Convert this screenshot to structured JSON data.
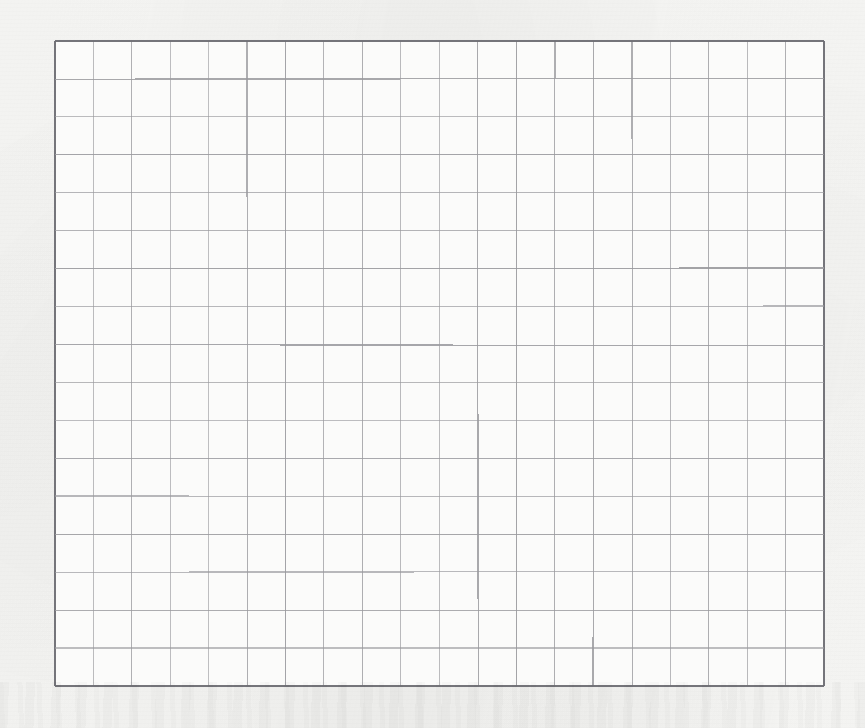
{
  "page": {
    "width": 865,
    "height": 728,
    "background_color": "#f7f7f5",
    "paper_tint": "#f4f4f2",
    "document_type": "scanned graph paper sheet",
    "visible_text": "",
    "annotations": []
  },
  "grid": {
    "label": "graph-paper-grid",
    "x": 55,
    "y": 41,
    "width": 769,
    "height": 645,
    "columns": 20,
    "rows": 17,
    "cell_width": 38.45,
    "cell_height": 37.94,
    "line_color": "#9a9a9e",
    "border_color": "#6e6e74",
    "line_width": 1.1,
    "border_width": 1.6,
    "fill_color": "#fbfbfa"
  },
  "chart_data": {
    "type": "table",
    "title": "",
    "subtitle": "",
    "xlabel": "",
    "ylabel": "",
    "categories": [],
    "values": [],
    "series": [],
    "legend": [],
    "grid": true,
    "legend_position": "none"
  }
}
